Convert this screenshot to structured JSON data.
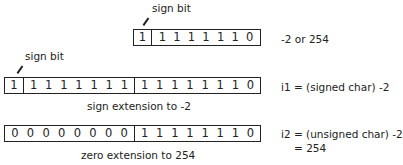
{
  "diagram": {
    "top": {
      "sign_label": "sign bit",
      "sign_bit": [
        "1"
      ],
      "byte_bits": [
        "1",
        "1",
        "1",
        "1",
        "1",
        "1",
        "1"
      ],
      "last_bit": "0",
      "description": "-2 or 254"
    },
    "middle": {
      "sign_label": "sign bit",
      "sign_bit": [
        "1"
      ],
      "ext_bits": [
        "1",
        "1",
        "1",
        "1",
        "1",
        "1",
        "1"
      ],
      "low_bits": [
        "1",
        "1",
        "1",
        "1",
        "1",
        "1",
        "1",
        "0"
      ],
      "caption": "sign extension to -2",
      "description": "i1 = (signed char) -2"
    },
    "bottom": {
      "high_bits": [
        "0",
        "0",
        "0",
        "0",
        "0",
        "0",
        "0",
        "0"
      ],
      "low_bits": [
        "1",
        "1",
        "1",
        "1",
        "1",
        "1",
        "1",
        "0"
      ],
      "caption": "zero extension to 254",
      "description_line1": "i2 = (unsigned char) -2",
      "description_line2": "= 254"
    }
  }
}
